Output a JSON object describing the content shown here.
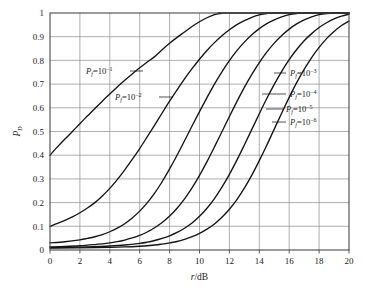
{
  "chart_data": {
    "type": "line",
    "title": "",
    "xlabel": "r/dB",
    "ylabel": "P_D",
    "xlabel_parts": {
      "italic": "r",
      "rest": "/dB"
    },
    "ylabel_parts": {
      "italic": "P",
      "subscript": "D"
    },
    "xlim": [
      0,
      20
    ],
    "ylim": [
      0,
      1
    ],
    "xticks": [
      0,
      2,
      4,
      6,
      8,
      10,
      12,
      14,
      16,
      18,
      20
    ],
    "xtick_labels": [
      "0",
      "2",
      "4",
      "6",
      "8",
      "10",
      "12",
      "14",
      "16",
      "18",
      "20"
    ],
    "yticks": [
      0,
      0.1,
      0.2,
      0.3,
      0.4,
      0.5,
      0.6,
      0.7,
      0.8,
      0.9,
      1
    ],
    "ytick_labels": [
      "0",
      "0.1",
      "0.2",
      "0.3",
      "0.4",
      "0.5",
      "0.6",
      "0.7",
      "0.8",
      "0.9",
      "1"
    ],
    "grid": true,
    "legend_position": "inline-annotations",
    "series": [
      {
        "name": "P_f = 10^-1",
        "label_base": "P",
        "label_subscript": "f",
        "label_equals": "=10",
        "label_exponent": "−1",
        "y_intercept": 0.4,
        "half_power_db": 1.9,
        "saturation_db": 11.0,
        "points": [
          [
            0,
            0.4
          ],
          [
            0.5,
            0.435
          ],
          [
            1,
            0.468
          ],
          [
            1.5,
            0.5
          ],
          [
            2,
            0.533
          ],
          [
            2.5,
            0.565
          ],
          [
            3,
            0.597
          ],
          [
            3.5,
            0.628
          ],
          [
            4,
            0.658
          ],
          [
            4.5,
            0.688
          ],
          [
            5,
            0.716
          ],
          [
            5.5,
            0.743
          ],
          [
            6,
            0.769
          ],
          [
            6.5,
            0.793
          ],
          [
            7,
            0.816
          ],
          [
            7.5,
            0.845
          ],
          [
            8,
            0.872
          ],
          [
            8.5,
            0.897
          ],
          [
            9,
            0.92
          ],
          [
            9.5,
            0.943
          ],
          [
            10,
            0.963
          ],
          [
            10.5,
            0.98
          ],
          [
            11,
            0.993
          ],
          [
            11.5,
            0.999
          ],
          [
            12,
            1.0
          ],
          [
            20,
            1.0
          ]
        ]
      },
      {
        "name": "P_f = 10^-2",
        "label_base": "P",
        "label_subscript": "f",
        "label_equals": "=10",
        "label_exponent": "−2",
        "y_intercept": 0.1,
        "half_power_db": 6.0,
        "saturation_db": 14.5,
        "points": [
          [
            0,
            0.1
          ],
          [
            0.5,
            0.112
          ],
          [
            1,
            0.125
          ],
          [
            1.5,
            0.14
          ],
          [
            2,
            0.157
          ],
          [
            2.5,
            0.177
          ],
          [
            3,
            0.2
          ],
          [
            3.5,
            0.228
          ],
          [
            4,
            0.26
          ],
          [
            4.5,
            0.297
          ],
          [
            5,
            0.338
          ],
          [
            5.5,
            0.382
          ],
          [
            6,
            0.428
          ],
          [
            6.5,
            0.477
          ],
          [
            7,
            0.527
          ],
          [
            7.5,
            0.578
          ],
          [
            8,
            0.628
          ],
          [
            8.5,
            0.676
          ],
          [
            9,
            0.722
          ],
          [
            9.5,
            0.765
          ],
          [
            10,
            0.805
          ],
          [
            10.5,
            0.842
          ],
          [
            11,
            0.875
          ],
          [
            11.5,
            0.904
          ],
          [
            12,
            0.929
          ],
          [
            12.5,
            0.951
          ],
          [
            13,
            0.968
          ],
          [
            13.5,
            0.982
          ],
          [
            14,
            0.992
          ],
          [
            14.5,
            0.998
          ],
          [
            15,
            1.0
          ],
          [
            20,
            1.0
          ]
        ]
      },
      {
        "name": "P_f = 10^-3",
        "label_base": "P",
        "label_subscript": "f",
        "label_equals": "=10",
        "label_exponent": "−3",
        "y_intercept": 0.03,
        "half_power_db": 8.4,
        "saturation_db": 16.0,
        "points": [
          [
            0,
            0.03
          ],
          [
            1,
            0.035
          ],
          [
            2,
            0.043
          ],
          [
            2.5,
            0.049
          ],
          [
            3,
            0.056
          ],
          [
            3.5,
            0.065
          ],
          [
            4,
            0.077
          ],
          [
            4.5,
            0.092
          ],
          [
            5,
            0.111
          ],
          [
            5.5,
            0.135
          ],
          [
            6,
            0.164
          ],
          [
            6.5,
            0.199
          ],
          [
            7,
            0.24
          ],
          [
            7.5,
            0.288
          ],
          [
            8,
            0.342
          ],
          [
            8.5,
            0.4
          ],
          [
            9,
            0.461
          ],
          [
            9.5,
            0.523
          ],
          [
            10,
            0.584
          ],
          [
            10.5,
            0.643
          ],
          [
            11,
            0.7
          ],
          [
            11.5,
            0.752
          ],
          [
            12,
            0.799
          ],
          [
            12.5,
            0.841
          ],
          [
            13,
            0.877
          ],
          [
            13.5,
            0.908
          ],
          [
            14,
            0.934
          ],
          [
            14.5,
            0.955
          ],
          [
            15,
            0.971
          ],
          [
            15.5,
            0.984
          ],
          [
            16,
            0.993
          ],
          [
            16.5,
            0.998
          ],
          [
            17,
            1.0
          ],
          [
            20,
            1.0
          ]
        ]
      },
      {
        "name": "P_f = 10^-4",
        "label_base": "P",
        "label_subscript": "f",
        "label_equals": "=10",
        "label_exponent": "−4",
        "y_intercept": 0.013,
        "half_power_db": 10.4,
        "saturation_db": 17.0,
        "points": [
          [
            0,
            0.013
          ],
          [
            1,
            0.015
          ],
          [
            2,
            0.018
          ],
          [
            3,
            0.023
          ],
          [
            3.5,
            0.026
          ],
          [
            4,
            0.03
          ],
          [
            4.5,
            0.035
          ],
          [
            5,
            0.042
          ],
          [
            5.5,
            0.051
          ],
          [
            6,
            0.062
          ],
          [
            6.5,
            0.076
          ],
          [
            7,
            0.094
          ],
          [
            7.5,
            0.116
          ],
          [
            8,
            0.143
          ],
          [
            8.5,
            0.176
          ],
          [
            9,
            0.216
          ],
          [
            9.5,
            0.262
          ],
          [
            10,
            0.315
          ],
          [
            10.5,
            0.373
          ],
          [
            11,
            0.435
          ],
          [
            11.5,
            0.499
          ],
          [
            12,
            0.563
          ],
          [
            12.5,
            0.626
          ],
          [
            13,
            0.686
          ],
          [
            13.5,
            0.741
          ],
          [
            14,
            0.791
          ],
          [
            14.5,
            0.835
          ],
          [
            15,
            0.873
          ],
          [
            15.5,
            0.905
          ],
          [
            16,
            0.932
          ],
          [
            16.5,
            0.954
          ],
          [
            17,
            0.971
          ],
          [
            17.5,
            0.984
          ],
          [
            18,
            0.993
          ],
          [
            18.5,
            0.998
          ],
          [
            19,
            1.0
          ],
          [
            20,
            1.0
          ]
        ]
      },
      {
        "name": "P_f = 10^-5",
        "label_base": "P",
        "label_subscript": "f",
        "label_equals": "=10",
        "label_exponent": "−5",
        "y_intercept": 0.01,
        "half_power_db": 11.9,
        "saturation_db": 17.5,
        "points": [
          [
            0,
            0.01
          ],
          [
            2,
            0.012
          ],
          [
            4,
            0.017
          ],
          [
            5,
            0.021
          ],
          [
            6,
            0.028
          ],
          [
            6.5,
            0.033
          ],
          [
            7,
            0.04
          ],
          [
            7.5,
            0.049
          ],
          [
            8,
            0.06
          ],
          [
            8.5,
            0.074
          ],
          [
            9,
            0.092
          ],
          [
            9.5,
            0.114
          ],
          [
            10,
            0.142
          ],
          [
            10.5,
            0.176
          ],
          [
            11,
            0.217
          ],
          [
            11.5,
            0.265
          ],
          [
            12,
            0.319
          ],
          [
            12.5,
            0.379
          ],
          [
            13,
            0.443
          ],
          [
            13.5,
            0.509
          ],
          [
            14,
            0.575
          ],
          [
            14.5,
            0.639
          ],
          [
            15,
            0.699
          ],
          [
            15.5,
            0.754
          ],
          [
            16,
            0.803
          ],
          [
            16.5,
            0.846
          ],
          [
            17,
            0.883
          ],
          [
            17.5,
            0.913
          ],
          [
            18,
            0.939
          ],
          [
            18.5,
            0.959
          ],
          [
            19,
            0.975
          ],
          [
            19.5,
            0.987
          ],
          [
            20,
            0.995
          ]
        ]
      },
      {
        "name": "P_f = 10^-6",
        "label_base": "P",
        "label_subscript": "f",
        "label_equals": "=10",
        "label_exponent": "−6",
        "y_intercept": 0.008,
        "half_power_db": 13.3,
        "saturation_db": 18.0,
        "points": [
          [
            0,
            0.008
          ],
          [
            3,
            0.01
          ],
          [
            5,
            0.013
          ],
          [
            6,
            0.016
          ],
          [
            7,
            0.021
          ],
          [
            7.5,
            0.025
          ],
          [
            8,
            0.03
          ],
          [
            8.5,
            0.036
          ],
          [
            9,
            0.045
          ],
          [
            9.5,
            0.056
          ],
          [
            10,
            0.07
          ],
          [
            10.5,
            0.088
          ],
          [
            11,
            0.11
          ],
          [
            11.5,
            0.138
          ],
          [
            12,
            0.172
          ],
          [
            12.5,
            0.213
          ],
          [
            13,
            0.261
          ],
          [
            13.5,
            0.316
          ],
          [
            14,
            0.377
          ],
          [
            14.5,
            0.442
          ],
          [
            15,
            0.51
          ],
          [
            15.5,
            0.578
          ],
          [
            16,
            0.644
          ],
          [
            16.5,
            0.706
          ],
          [
            17,
            0.762
          ],
          [
            17.5,
            0.812
          ],
          [
            18,
            0.855
          ],
          [
            18.5,
            0.892
          ],
          [
            19,
            0.922
          ],
          [
            19.5,
            0.947
          ],
          [
            20,
            0.966
          ]
        ]
      }
    ],
    "annotations": [
      {
        "id": "label-pf-1",
        "base": "P",
        "subscript": "f",
        "equals": "=10",
        "exponent": "−1",
        "text_x": 86,
        "text_y": 74,
        "leader_from_x": 130,
        "leader_to_x": 143,
        "leader_y": 71,
        "anchor": "start"
      },
      {
        "id": "label-pf-2",
        "base": "P",
        "subscript": "f",
        "equals": "=10",
        "exponent": "−2",
        "text_x": 115,
        "text_y": 100,
        "leader_from_x": 159,
        "leader_to_x": 173,
        "leader_y": 97,
        "anchor": "start"
      },
      {
        "id": "label-pf-3",
        "base": "P",
        "subscript": "f",
        "equals": "=10",
        "exponent": "−3",
        "text_x": 290,
        "text_y": 76,
        "leader_from_x": 274,
        "leader_to_x": 286,
        "leader_y": 73,
        "anchor": "start"
      },
      {
        "id": "label-pf-4",
        "base": "P",
        "subscript": "f",
        "equals": "=10",
        "exponent": "−4",
        "text_x": 290,
        "text_y": 97,
        "leader_from_x": 262,
        "leader_to_x": 286,
        "leader_y": 94,
        "anchor": "start"
      },
      {
        "id": "label-pf-5",
        "base": "P",
        "subscript": "f",
        "equals": "=10",
        "exponent": "−5",
        "text_x": 286,
        "text_y": 112,
        "leader_from_x": 266,
        "leader_to_x": 283,
        "leader_y": 109,
        "anchor": "start"
      },
      {
        "id": "label-pf-6",
        "base": "P",
        "subscript": "f",
        "equals": "=10",
        "exponent": "−6",
        "text_x": 290,
        "text_y": 125,
        "leader_from_x": 272,
        "leader_to_x": 286,
        "leader_y": 122,
        "anchor": "start"
      }
    ],
    "colors": {
      "background": "#ffffff",
      "grid": "#8d8d8d",
      "frame": "#4a4a4a",
      "curve": "#141414",
      "text": "#1a1a1a"
    }
  }
}
